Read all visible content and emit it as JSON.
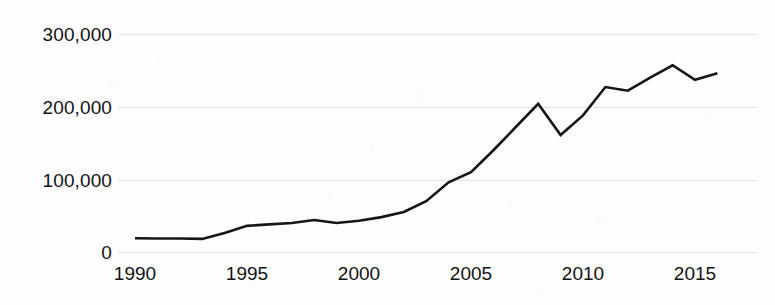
{
  "chart_data": {
    "type": "line",
    "title": "",
    "subtitle": "",
    "xlabel": "",
    "ylabel": "",
    "grid": true,
    "legend": false,
    "xlim": [
      1990,
      2016
    ],
    "ylim": [
      0,
      300000
    ],
    "y_ticks": [
      0,
      100000,
      200000,
      300000
    ],
    "y_tick_labels": [
      "0",
      "100,000",
      "200,000",
      "300,000"
    ],
    "x_ticks": [
      1990,
      1995,
      2000,
      2005,
      2010,
      2015
    ],
    "x_tick_labels": [
      "1990",
      "1995",
      "2000",
      "2005",
      "2010",
      "2015"
    ],
    "series": [
      {
        "name": "",
        "color": "#161616",
        "x": [
          1990,
          1991,
          1992,
          1993,
          1994,
          1995,
          1996,
          1997,
          1998,
          1999,
          2000,
          2001,
          2002,
          2003,
          2004,
          2005,
          2006,
          2007,
          2008,
          2009,
          2010,
          2011,
          2012,
          2013,
          2014,
          2015,
          2016
        ],
        "values": [
          19000,
          18500,
          18500,
          18000,
          26000,
          36000,
          38000,
          40000,
          44000,
          40000,
          43000,
          48000,
          55000,
          70000,
          96000,
          110000,
          140000,
          172000,
          204000,
          161000,
          188000,
          227000,
          222000,
          240000,
          257000,
          237000,
          246000
        ]
      }
    ]
  },
  "axis": {
    "y_unit_note": "",
    "x_unit_note": ""
  }
}
